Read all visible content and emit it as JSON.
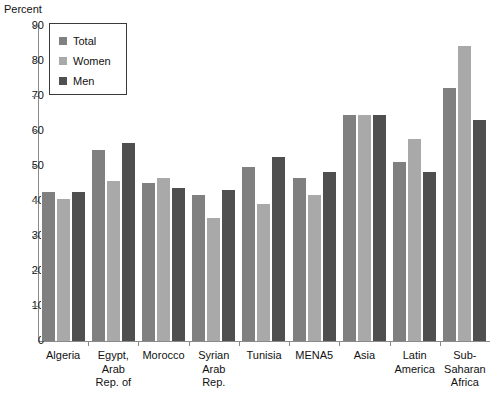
{
  "chart_data": {
    "type": "bar",
    "title": "",
    "subtitle": "",
    "xlabel": "",
    "ylabel": "Percent",
    "ylim": [
      0,
      90
    ],
    "ytick_step": 10,
    "yticks": [
      90,
      80,
      70,
      60,
      50,
      40,
      30,
      20,
      10,
      0
    ],
    "grid": false,
    "legend_position": "top-left",
    "categories": [
      "Algeria",
      "Egypt, Arab Rep. of",
      "Morocco",
      "Syrian Arab Rep.",
      "Tunisia",
      "MENA5",
      "Asia",
      "Latin America",
      "Sub-Saharan Africa"
    ],
    "category_lines": [
      [
        "Algeria"
      ],
      [
        "Egypt,",
        "Arab",
        "Rep. of"
      ],
      [
        "Morocco"
      ],
      [
        "Syrian",
        "Arab",
        "Rep."
      ],
      [
        "Tunisia"
      ],
      [
        "MENA5"
      ],
      [
        "Asia"
      ],
      [
        "Latin",
        "America"
      ],
      [
        "Sub-",
        "Saharan",
        "Africa"
      ]
    ],
    "series": [
      {
        "name": "Total",
        "color": "#808080",
        "values": [
          43.0,
          55.0,
          45.5,
          42.0,
          50.0,
          47.0,
          65.0,
          51.5,
          72.5
        ]
      },
      {
        "name": "Women",
        "color": "#a9a9a9",
        "values": [
          41.0,
          46.0,
          47.0,
          35.5,
          39.5,
          42.0,
          65.0,
          58.0,
          84.5
        ]
      },
      {
        "name": "Men",
        "color": "#4f4f4f",
        "values": [
          43.0,
          57.0,
          44.0,
          43.5,
          53.0,
          48.5,
          65.0,
          48.5,
          63.5
        ]
      }
    ]
  },
  "axis": {
    "y_title": "Percent"
  },
  "legend": {
    "items": [
      {
        "label": "Total",
        "color": "#808080"
      },
      {
        "label": "Women",
        "color": "#a9a9a9"
      },
      {
        "label": "Men",
        "color": "#4f4f4f"
      }
    ]
  }
}
